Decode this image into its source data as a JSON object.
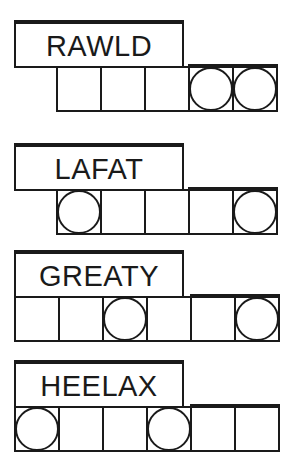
{
  "puzzles": [
    {
      "scrambled": "RAWLD",
      "cells_start_x": 56,
      "cells": [
        {
          "circled": false,
          "thick_top": false
        },
        {
          "circled": false,
          "thick_top": false
        },
        {
          "circled": false,
          "thick_top": false
        },
        {
          "circled": true,
          "thick_top": true
        },
        {
          "circled": true,
          "thick_top": true
        }
      ]
    },
    {
      "scrambled": "LAFAT",
      "cells_start_x": 56,
      "cells": [
        {
          "circled": true,
          "thick_top": false
        },
        {
          "circled": false,
          "thick_top": false
        },
        {
          "circled": false,
          "thick_top": false
        },
        {
          "circled": false,
          "thick_top": true
        },
        {
          "circled": true,
          "thick_top": true
        }
      ]
    },
    {
      "scrambled": "GREATY",
      "cells_start_x": 14,
      "cells": [
        {
          "circled": false,
          "thick_top": false
        },
        {
          "circled": false,
          "thick_top": false
        },
        {
          "circled": true,
          "thick_top": false
        },
        {
          "circled": false,
          "thick_top": false
        },
        {
          "circled": false,
          "thick_top": true
        },
        {
          "circled": true,
          "thick_top": true
        }
      ]
    },
    {
      "scrambled": "HEELAX",
      "cells_start_x": 14,
      "cells": [
        {
          "circled": true,
          "thick_top": false
        },
        {
          "circled": false,
          "thick_top": false
        },
        {
          "circled": false,
          "thick_top": false
        },
        {
          "circled": true,
          "thick_top": false
        },
        {
          "circled": false,
          "thick_top": true
        },
        {
          "circled": false,
          "thick_top": true
        }
      ]
    }
  ],
  "layout": {
    "puzzle_tops": [
      20,
      143,
      250,
      360
    ]
  },
  "colors": {
    "ink": "#1a1a1a",
    "background": "#ffffff"
  }
}
